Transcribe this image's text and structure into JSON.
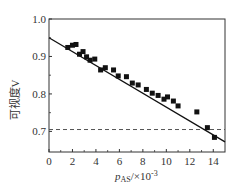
{
  "chart_data": {
    "type": "scatter",
    "title": "",
    "xlabel": "p_AS/×10^-3",
    "xlabel_main": "p",
    "xlabel_sub": "AS",
    "xlabel_suffix": "/×10",
    "xlabel_exp": "-3",
    "ylabel": "可视度V",
    "xlim": [
      0,
      15
    ],
    "ylim": [
      0.645,
      1.0
    ],
    "xticks": [
      0,
      2,
      4,
      6,
      8,
      10,
      12,
      14
    ],
    "yticks": [
      0.7,
      0.8,
      0.9,
      1.0
    ],
    "ytick_labels": [
      "0.7",
      "0.8",
      "0.9",
      "1.0"
    ],
    "grid": false,
    "series": [
      {
        "name": "measured",
        "marker": "square",
        "color": "#111111",
        "points": [
          [
            1.6,
            0.924
          ],
          [
            2.0,
            0.93
          ],
          [
            2.3,
            0.932
          ],
          [
            2.6,
            0.906
          ],
          [
            2.9,
            0.913
          ],
          [
            3.2,
            0.899
          ],
          [
            3.5,
            0.89
          ],
          [
            3.9,
            0.893
          ],
          [
            4.4,
            0.864
          ],
          [
            4.8,
            0.87
          ],
          [
            5.5,
            0.864
          ],
          [
            5.9,
            0.848
          ],
          [
            6.6,
            0.846
          ],
          [
            7.1,
            0.829
          ],
          [
            7.6,
            0.824
          ],
          [
            8.3,
            0.812
          ],
          [
            8.8,
            0.802
          ],
          [
            9.3,
            0.796
          ],
          [
            9.8,
            0.786
          ],
          [
            10.1,
            0.792
          ],
          [
            10.6,
            0.781
          ],
          [
            11.0,
            0.768
          ],
          [
            12.6,
            0.752
          ],
          [
            13.5,
            0.71
          ],
          [
            14.1,
            0.684
          ]
        ]
      },
      {
        "name": "linear fit",
        "type": "line",
        "color": "#111111",
        "points": [
          [
            0,
            0.95
          ],
          [
            15,
            0.672
          ]
        ]
      },
      {
        "name": "threshold",
        "type": "dashed-line",
        "color": "#555555",
        "points": [
          [
            0,
            0.705
          ],
          [
            15,
            0.705
          ]
        ]
      }
    ]
  }
}
